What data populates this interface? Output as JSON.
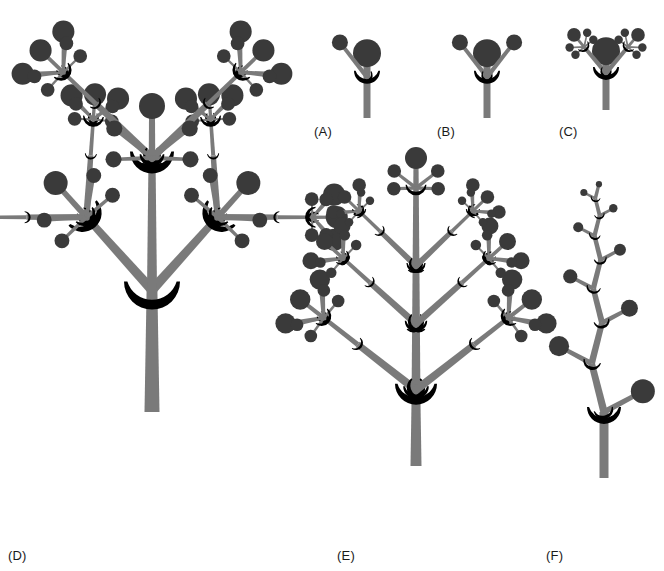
{
  "figure": {
    "background_color": "#ffffff",
    "stem_color": "#7a7a7a",
    "node_color": "#3a3a3a",
    "crescent_color": "#000000",
    "label_color": "#1a1a1a",
    "width": 664,
    "height": 571
  },
  "panels": [
    {
      "id": "A",
      "label": "(A)",
      "name": "single-lateral-branch-model",
      "label_x": 314,
      "label_y": 124,
      "origin_x": 367,
      "origin_y": 118,
      "trunk_length": 62,
      "trunk_width": 7,
      "trunk_taper": 1.0,
      "apex_radius": 14,
      "branches": [
        {
          "angle": -38,
          "length": 44,
          "width": 4.5,
          "tip_radius": 8,
          "crescent": true,
          "depth": 0
        }
      ],
      "base_crescent": true,
      "base_crescent_size": 26,
      "depth": 1,
      "description": "Monopodial stem with one lateral branch"
    },
    {
      "id": "B",
      "label": "(B)",
      "name": "paired-lateral-branch-model",
      "label_x": 437,
      "label_y": 124,
      "origin_x": 487,
      "origin_y": 118,
      "trunk_length": 62,
      "trunk_width": 7,
      "trunk_taper": 1.0,
      "apex_radius": 14,
      "branches": [
        {
          "angle": -38,
          "length": 44,
          "width": 4.5,
          "tip_radius": 8,
          "crescent": true,
          "depth": 0
        },
        {
          "angle": 38,
          "length": 44,
          "width": 4.5,
          "tip_radius": 8,
          "crescent": true,
          "depth": 0
        }
      ],
      "base_crescent": true,
      "base_crescent_size": 26,
      "depth": 1,
      "description": "Monopodial stem with two opposite lateral branches"
    },
    {
      "id": "C",
      "label": "(C)",
      "name": "second-order-branch-model",
      "label_x": 559,
      "label_y": 124,
      "origin_x": 606,
      "origin_y": 110,
      "trunk_length": 56,
      "trunk_width": 7,
      "trunk_taper": 1.0,
      "apex_radius": 14,
      "branches": [
        {
          "angle": -40,
          "length": 34,
          "width": 4.5,
          "tip_radius": 8,
          "crescent": true,
          "depth": 1
        },
        {
          "angle": 40,
          "length": 34,
          "width": 4.5,
          "tip_radius": 8,
          "crescent": true,
          "depth": 1
        }
      ],
      "base_crescent": true,
      "base_crescent_size": 26,
      "depth": 2,
      "description": "Two orders of branching, whorled sub-branches"
    },
    {
      "id": "D",
      "label": "(D)",
      "name": "large-fractal-tree-model",
      "label_x": 8,
      "label_y": 548,
      "origin_x": 152,
      "origin_y": 412,
      "trunk_length": 122,
      "trunk_width": 15,
      "trunk_taper": 0.72,
      "apex_radius": 0,
      "branches": [
        {
          "angle": -42,
          "length": 98,
          "width": 10,
          "tip_radius": 0,
          "crescent": true,
          "depth": 3
        },
        {
          "angle": 42,
          "length": 98,
          "width": 10,
          "tip_radius": 0,
          "crescent": true,
          "depth": 3
        },
        {
          "angle": 0,
          "length": 132,
          "width": 10,
          "tip_radius": 0,
          "crescent": false,
          "depth": 3
        }
      ],
      "base_crescent": true,
      "base_crescent_size": 56,
      "depth": 4,
      "description": "Large sympodial tree, four orders of branching"
    },
    {
      "id": "E",
      "label": "(E)",
      "name": "monopodial-whorled-tiers-model",
      "label_x": 337,
      "label_y": 548,
      "origin_x": 416,
      "origin_y": 466,
      "trunk_length": 76,
      "trunk_width": 11,
      "trunk_taper": 0.78,
      "apex_radius": 0,
      "tiers": [
        {
          "angle": 52,
          "length": 74,
          "width": 8,
          "depth": 2,
          "rise": 0
        },
        {
          "angle": 48,
          "length": 62,
          "width": 7,
          "depth": 2,
          "rise": 66
        },
        {
          "angle": 46,
          "length": 50,
          "width": 6,
          "depth": 2,
          "rise": 124
        },
        {
          "angle": 0,
          "length": 0,
          "width": 5,
          "depth": 2,
          "rise": 172
        }
      ],
      "apex_depth": 1,
      "apex_length": 30,
      "base_crescent": true,
      "base_crescent_size": 42,
      "depth": 3,
      "description": "Monopodial leader with four tiers of paired branches"
    },
    {
      "id": "F",
      "label": "(F)",
      "name": "zigzag-sympodial-model",
      "label_x": 546,
      "label_y": 548,
      "origin_x": 604,
      "origin_y": 478,
      "trunk_length": 66,
      "trunk_width": 9,
      "trunk_taper": 1.0,
      "segments": 8,
      "segment_angle": 26,
      "lateral_angle": 62,
      "first_segment_length": 50,
      "length_ratio": 0.84,
      "first_lateral_length": 44,
      "first_tip_radius": 12,
      "radius_ratio": 0.84,
      "base_crescent": true,
      "base_crescent_size": 34,
      "description": "Sympodial zigzag axis with alternating laterals"
    }
  ],
  "legend": {
    "stem_label": "stem / branch axis",
    "node_label": "terminal apex",
    "crescent_label": "branch junction scar"
  }
}
